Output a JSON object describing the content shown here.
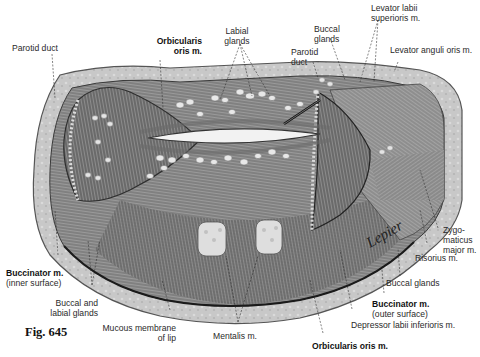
{
  "figure": {
    "number": "Fig. 645",
    "signature": "Lepier",
    "palette": {
      "background": "#ffffff",
      "muscle_dark": "#4a4a4a",
      "muscle_mid": "#8a8a8a",
      "muscle_light": "#bdbdbd",
      "mucosa": "#c9c9c9",
      "gland": "#e6e6e6",
      "label_text": "#2a2a2a"
    }
  },
  "labels": {
    "parotid_duct_left": "Parotid duct",
    "orbicularis_top_1": "Orbicularis",
    "orbicularis_top_2": "oris m.",
    "labial_glands_1": "Labial",
    "labial_glands_2": "glands",
    "buccal_glands_top_1": "Buccal",
    "buccal_glands_top_2": "glands",
    "parotid_duct_right_1": "Parotid",
    "parotid_duct_right_2": "duct",
    "levator_labii_1": "Levator labii",
    "levator_labii_2": "superioris m.",
    "levator_anguli": "Levator anguli oris m.",
    "zygomaticus_1": "Zygo-",
    "zygomaticus_2": "maticus",
    "zygomaticus_3": "major m.",
    "risorius": "Risorius m.",
    "buccal_glands_right": "Buccal glands",
    "buccinator_outer_1": "Buccinator m.",
    "buccinator_outer_2": "(outer surface)",
    "depressor_labii": "Depressor labii inferioris m.",
    "orbicularis_bottom": "Orbicularis oris m.",
    "mentalis": "Mentalis m.",
    "mucous_membrane_1": "Mucous membrane",
    "mucous_membrane_2": "of lip",
    "buccal_labial_glands_1": "Buccal and",
    "buccal_labial_glands_2": "labial glands",
    "buccinator_inner_1": "Buccinator m.",
    "buccinator_inner_2": "(inner surface)"
  }
}
